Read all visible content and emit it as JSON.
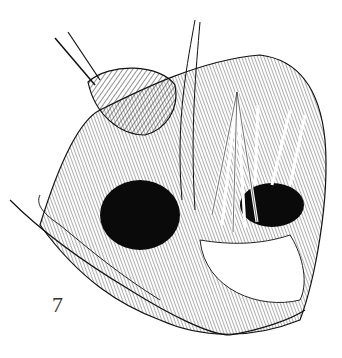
{
  "figure": {
    "number": "7",
    "colors": {
      "ink": "#111111",
      "paper": "#ffffff",
      "shade": "#555555"
    }
  }
}
